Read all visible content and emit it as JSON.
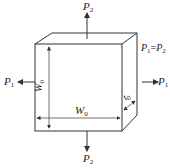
{
  "diagram": {
    "type": "stress-cube",
    "labels": {
      "p2_top": {
        "sym": "P",
        "sub": "2"
      },
      "p2_bottom": {
        "sym": "P",
        "sub": "2"
      },
      "p1_left": {
        "sym": "P",
        "sub": "1"
      },
      "p1_right": {
        "sym": "P",
        "sub": "1"
      },
      "equality": {
        "lhs": "P",
        "lhs_sub": "1",
        "eq": "=",
        "rhs": "P",
        "rhs_sub": "2"
      },
      "height_dim": {
        "sym": "W",
        "sub": "0"
      },
      "width_dim": {
        "sym": "W",
        "sub": "0"
      },
      "thickness_dim": {
        "sym": "t",
        "sub": "0"
      }
    },
    "colors": {
      "line": "#333333",
      "background": "#ffffff"
    }
  }
}
